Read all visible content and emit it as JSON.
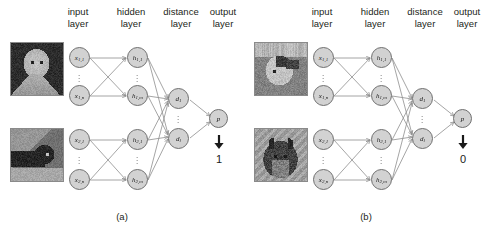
{
  "figure": {
    "type": "neural-network-diagram",
    "panels": [
      {
        "id": "a",
        "caption": "(a)",
        "layer_labels": [
          {
            "line1": "input",
            "line2": "layer"
          },
          {
            "line1": "hidden",
            "line2": "layer"
          },
          {
            "line1": "distance",
            "line2": "layer"
          },
          {
            "line1": "output",
            "line2": "layer"
          }
        ],
        "images": [
          {
            "name": "input-image-top",
            "alt": "white cat on dark background"
          },
          {
            "name": "input-image-bottom",
            "alt": "dark cat on light background"
          }
        ],
        "input_nodes": [
          {
            "base": "x",
            "sub": "1,1"
          },
          {
            "base": "x",
            "sub": "1,n"
          },
          {
            "base": "x",
            "sub": "2,1"
          },
          {
            "base": "x",
            "sub": "2,n"
          }
        ],
        "hidden_nodes": [
          {
            "base": "h",
            "sub": "1,1"
          },
          {
            "base": "h",
            "sub": "1,m"
          },
          {
            "base": "h",
            "sub": "2,1"
          },
          {
            "base": "h",
            "sub": "2,m"
          }
        ],
        "distance_nodes": [
          {
            "base": "d",
            "sub": "1"
          },
          {
            "base": "d",
            "sub": "l"
          }
        ],
        "output_node": {
          "base": "p",
          "sub": ""
        },
        "result": "1",
        "arrow_glyph": "down-arrow",
        "ellipsis_glyph": "vertical-dots"
      },
      {
        "id": "b",
        "caption": "(b)",
        "layer_labels": [
          {
            "line1": "input",
            "line2": "layer"
          },
          {
            "line1": "hidden",
            "line2": "layer"
          },
          {
            "line1": "distance",
            "line2": "layer"
          },
          {
            "line1": "output",
            "line2": "layer"
          }
        ],
        "images": [
          {
            "name": "input-image-top",
            "alt": "white and dark cat in profile"
          },
          {
            "name": "input-image-bottom",
            "alt": "dark schnauzer dog"
          }
        ],
        "input_nodes": [
          {
            "base": "x",
            "sub": "1,1"
          },
          {
            "base": "x",
            "sub": "1,n"
          },
          {
            "base": "x",
            "sub": "2,1"
          },
          {
            "base": "x",
            "sub": "2,n"
          }
        ],
        "hidden_nodes": [
          {
            "base": "h",
            "sub": "1,1"
          },
          {
            "base": "h",
            "sub": "1,m"
          },
          {
            "base": "h",
            "sub": "2,1"
          },
          {
            "base": "h",
            "sub": "2,m"
          }
        ],
        "distance_nodes": [
          {
            "base": "d",
            "sub": "1"
          },
          {
            "base": "d",
            "sub": "l"
          }
        ],
        "output_node": {
          "base": "p",
          "sub": ""
        },
        "result": "0",
        "arrow_glyph": "down-arrow",
        "ellipsis_glyph": "vertical-dots"
      }
    ],
    "colors": {
      "node_fill": "#d2d2d2",
      "node_stroke": "#6f6f6f",
      "edge": "#8e8e8e",
      "text": "#231f20",
      "background": "#ffffff"
    }
  }
}
